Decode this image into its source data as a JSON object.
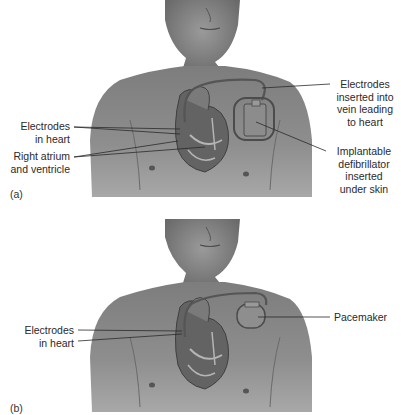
{
  "figure": {
    "panels": [
      {
        "id": "a",
        "tag": "(a)",
        "device": "Implantable defibrillator",
        "labels": {
          "electrodes_heart_1": "Electrodes",
          "electrodes_heart_2": "in heart",
          "atrium_1": "Right atrium",
          "atrium_2": "and ventricle",
          "vein_1": "Electrodes",
          "vein_2": "inserted into",
          "vein_3": "vein leading",
          "vein_4": "to heart",
          "device_1": "Implantable",
          "device_2": "defibrillator",
          "device_3": "inserted",
          "device_4": "under skin"
        }
      },
      {
        "id": "b",
        "tag": "(b)",
        "device": "Pacemaker",
        "labels": {
          "electrodes_heart_1": "Electrodes",
          "electrodes_heart_2": "in heart",
          "pacemaker": "Pacemaker"
        }
      }
    ],
    "colors": {
      "skin": "#8a8a8a",
      "skin_dark": "#5e5e5e",
      "heart": "#6f6f6f",
      "leader_line": "#2a2a2a",
      "background": "#ffffff"
    }
  }
}
